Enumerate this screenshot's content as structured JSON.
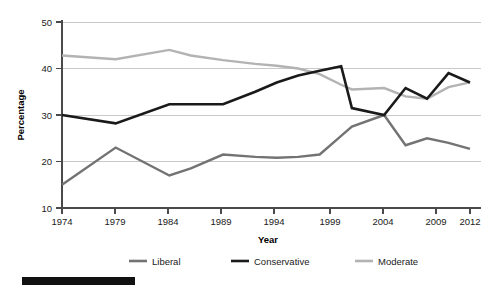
{
  "chart_data": {
    "type": "line",
    "title": "",
    "xlabel": "Year",
    "ylabel": "Percentage",
    "xlim": [
      1974,
      2012
    ],
    "ylim": [
      10,
      50
    ],
    "yticks": [
      10,
      20,
      30,
      40,
      50
    ],
    "xticks": [
      1974,
      1979,
      1984,
      1989,
      1994,
      1999,
      2004,
      2009,
      2012
    ],
    "grid": "horizontal",
    "legend_position": "bottom",
    "x": [
      1974,
      1979,
      1984,
      1986,
      1989,
      1992,
      1994,
      1996,
      1998,
      2000,
      2001,
      2004,
      2006,
      2008,
      2010,
      2012
    ],
    "series": [
      {
        "name": "Liberal",
        "color": "#737373",
        "values": [
          15.0,
          23.0,
          17.0,
          18.5,
          21.5,
          21.0,
          20.8,
          21.0,
          21.5,
          25.5,
          27.5,
          30.0,
          23.5,
          25.0,
          24.0,
          22.7
        ]
      },
      {
        "name": "Conservative",
        "color": "#1a1a1a",
        "values": [
          30.0,
          28.2,
          32.3,
          32.3,
          32.3,
          35.0,
          37.0,
          38.5,
          39.5,
          40.5,
          31.5,
          30.0,
          35.8,
          33.5,
          39.0,
          37.0
        ]
      },
      {
        "name": "Moderate",
        "color": "#b3b3b3",
        "values": [
          42.8,
          42.0,
          44.0,
          42.8,
          41.8,
          41.0,
          40.6,
          40.0,
          38.8,
          36.5,
          35.5,
          35.8,
          34.0,
          33.5,
          36.0,
          37.0
        ]
      }
    ]
  },
  "axes": {
    "y_label": "Percentage",
    "x_label": "Year",
    "y_ticks": [
      "50",
      "40",
      "30",
      "20",
      "10"
    ],
    "x_ticks": [
      "1974",
      "1979",
      "1984",
      "1989",
      "1994",
      "1999",
      "2004",
      "2009",
      "2012"
    ]
  },
  "legend": {
    "items": [
      {
        "label": "Liberal",
        "color": "#737373"
      },
      {
        "label": "Conservative",
        "color": "#1a1a1a"
      },
      {
        "label": "Moderate",
        "color": "#b3b3b3"
      }
    ]
  }
}
